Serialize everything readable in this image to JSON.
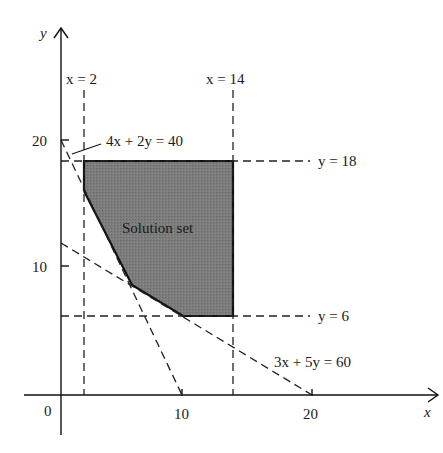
{
  "diagram": {
    "type": "linear-programming-feasible-region",
    "axes": {
      "x_label": "x",
      "y_label": "y",
      "origin_label": "0",
      "x_ticks": [
        "10",
        "20"
      ],
      "y_ticks": [
        "10",
        "20"
      ]
    },
    "constraint_lines": {
      "x_eq_2": "x = 2",
      "x_eq_14": "x = 14",
      "y_eq_18": "y = 18",
      "y_eq_6": "y = 6",
      "line_4x2y": "4x + 2y = 40",
      "line_3x5y": "3x + 5y = 60"
    },
    "region_label": "Solution set",
    "region_vertices": [
      [
        2,
        18
      ],
      [
        14,
        18
      ],
      [
        14,
        6
      ],
      [
        10,
        6
      ],
      [
        5.71,
        8.57
      ],
      [
        2,
        16
      ]
    ],
    "colors": {
      "region_fill": "#7a7a7a",
      "lines": "#1a1a1a",
      "background": "#ffffff"
    }
  }
}
